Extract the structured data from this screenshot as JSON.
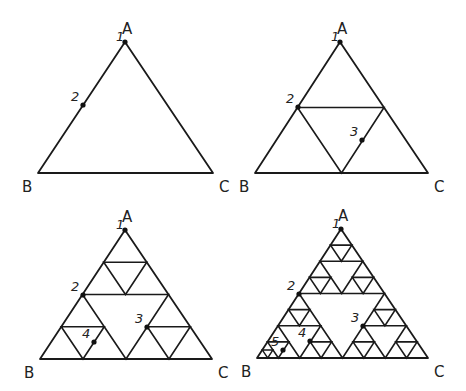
{
  "panels": [
    {
      "id": "panel-1",
      "depth": 0,
      "extra_corner_depth": 0,
      "vertices": {
        "A": [
          125,
          42
        ],
        "B": [
          38,
          173
        ],
        "C": [
          213,
          173
        ]
      },
      "vertex_labels": {
        "A": "A",
        "B": "B",
        "C": "C"
      },
      "points": [
        {
          "label": "1",
          "pos": [
            125,
            42
          ]
        },
        {
          "label": "2",
          "pos": [
            83,
            105
          ]
        }
      ]
    },
    {
      "id": "panel-2",
      "depth": 1,
      "extra_corner_depth": 0,
      "vertices": {
        "A": [
          340,
          42
        ],
        "B": [
          255,
          173
        ],
        "C": [
          428,
          173
        ]
      },
      "vertex_labels": {
        "A": "A",
        "B": "B",
        "C": "C"
      },
      "points": [
        {
          "label": "1",
          "pos": [
            340,
            42
          ]
        },
        {
          "label": "2",
          "pos": [
            298,
            107
          ]
        },
        {
          "label": "3",
          "pos": [
            362,
            140
          ]
        }
      ]
    },
    {
      "id": "panel-3",
      "depth": 2,
      "extra_corner_depth": 0,
      "vertices": {
        "A": [
          125,
          230
        ],
        "B": [
          40,
          359
        ],
        "C": [
          212,
          359
        ]
      },
      "vertex_labels": {
        "A": "A",
        "B": "B",
        "C": "C"
      },
      "points": [
        {
          "label": "1",
          "pos": [
            125,
            230
          ]
        },
        {
          "label": "2",
          "pos": [
            83,
            295
          ]
        },
        {
          "label": "3",
          "pos": [
            147,
            327
          ]
        },
        {
          "label": "4",
          "pos": [
            94,
            342
          ]
        }
      ]
    },
    {
      "id": "panel-4",
      "depth": 3,
      "extra_corner_depth": 1,
      "vertices": {
        "A": [
          341,
          229
        ],
        "B": [
          257,
          358
        ],
        "C": [
          428,
          358
        ]
      },
      "vertex_labels": {
        "A": "A",
        "B": "B",
        "C": "C"
      },
      "points": [
        {
          "label": "1",
          "pos": [
            341,
            229
          ]
        },
        {
          "label": "2",
          "pos": [
            299,
            294
          ]
        },
        {
          "label": "3",
          "pos": [
            363,
            326
          ]
        },
        {
          "label": "4",
          "pos": [
            310,
            341
          ]
        },
        {
          "label": "5",
          "pos": [
            283,
            350
          ]
        }
      ]
    }
  ],
  "style": {
    "stroke": "#1a1a1a",
    "point_color": "#111111"
  }
}
